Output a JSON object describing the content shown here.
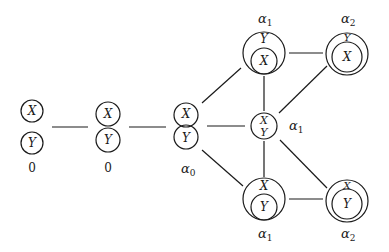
{
  "diagram": {
    "type": "graph",
    "variables": {
      "x": "X",
      "y": "Y"
    },
    "nodes": [
      {
        "id": "n0",
        "relation": "separate",
        "label": "0",
        "label_base": "0",
        "label_sub": ""
      },
      {
        "id": "n1",
        "relation": "touching",
        "label": "0",
        "label_base": "0",
        "label_sub": ""
      },
      {
        "id": "n2",
        "relation": "overlapping",
        "label": "α0",
        "label_base": "α",
        "label_sub": "0"
      },
      {
        "id": "n3",
        "relation": "X inside Y, internally tangent",
        "label": "α1",
        "label_base": "α",
        "label_sub": "1"
      },
      {
        "id": "n4",
        "relation": "X inside Y, non-tangent",
        "label": "α2",
        "label_base": "α",
        "label_sub": "2"
      },
      {
        "id": "n5",
        "relation": "equal (X = Y)",
        "label": "α1",
        "label_base": "α",
        "label_sub": "1"
      },
      {
        "id": "n6",
        "relation": "Y inside X, internally tangent",
        "label": "α1",
        "label_base": "α",
        "label_sub": "1"
      },
      {
        "id": "n7",
        "relation": "Y inside X, non-tangent",
        "label": "α2",
        "label_base": "α",
        "label_sub": "2"
      }
    ],
    "edges": [
      [
        "n0",
        "n1"
      ],
      [
        "n1",
        "n2"
      ],
      [
        "n2",
        "n3"
      ],
      [
        "n2",
        "n5"
      ],
      [
        "n2",
        "n6"
      ],
      [
        "n3",
        "n4"
      ],
      [
        "n3",
        "n5"
      ],
      [
        "n5",
        "n4"
      ],
      [
        "n5",
        "n6"
      ],
      [
        "n5",
        "n7"
      ],
      [
        "n6",
        "n7"
      ]
    ]
  }
}
